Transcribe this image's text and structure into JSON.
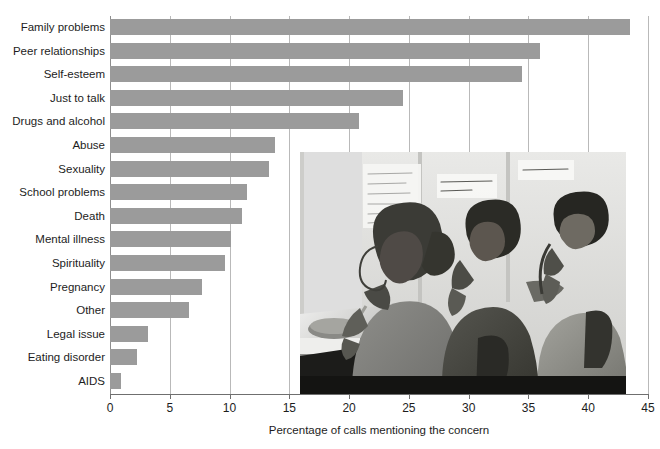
{
  "chart_data": {
    "type": "bar",
    "orientation": "horizontal",
    "title": "",
    "xlabel": "Percentage of calls mentioning the concern",
    "ylabel": "",
    "xlim": [
      0,
      45
    ],
    "xticks": [
      0,
      5,
      10,
      15,
      20,
      25,
      30,
      35,
      40,
      45
    ],
    "xtick_labels": [
      "0",
      "5",
      "10",
      "15",
      "20",
      "25",
      "30",
      "35",
      "40",
      "45"
    ],
    "grid": true,
    "grid_axis": "x",
    "legend": false,
    "bar_color": "#9b9b9b",
    "categories": [
      "Family problems",
      "Peer relationships",
      "Self-esteem",
      "Just to talk",
      "Drugs and alcohol",
      "Abuse",
      "Sexuality",
      "School problems",
      "Death",
      "Mental illness",
      "Spirituality",
      "Pregnancy",
      "Other",
      "Legal issue",
      "Eating disorder",
      "AIDS"
    ],
    "values": [
      43.5,
      36.0,
      34.5,
      24.5,
      20.8,
      13.8,
      13.3,
      11.5,
      11.0,
      10.1,
      9.6,
      7.7,
      6.6,
      3.2,
      2.3,
      0.9
    ]
  },
  "axis": {
    "x_title": "Percentage of calls mentioning the concern"
  },
  "photo": {
    "caption_alt": "black-and-white photograph of three volunteers answering telephones at a crisis hotline",
    "notes_on_wall": [
      "Before you can solve the problem, hear them out; don't drop them, and they won't drop you.",
      "LISTEN WITH CARE SAVE A LIFE!",
      "SUICIDE HOT LINE"
    ]
  }
}
